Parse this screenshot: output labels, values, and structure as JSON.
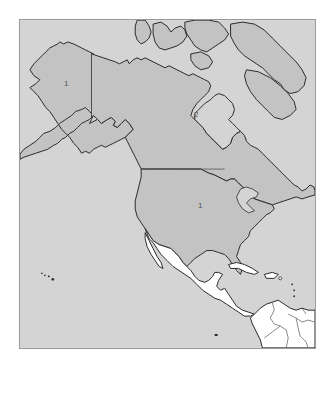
{
  "map": {
    "subject": "North America",
    "colors": {
      "ocean": "#d4d4d4",
      "highlighted_land": "#c3c3c3",
      "other_land": "#ffffff",
      "coastline": "#2a2a2a",
      "internal_border": "#555555",
      "frame": "#9a9a9a"
    },
    "regions": [
      {
        "name": "Alaska",
        "label": "1",
        "shaded": true
      },
      {
        "name": "Canada",
        "label": "2",
        "shaded": true
      },
      {
        "name": "Contiguous United States",
        "label": "1",
        "shaded": true
      },
      {
        "name": "Mexico",
        "label": "",
        "shaded": false
      },
      {
        "name": "Central America",
        "label": "",
        "shaded": false
      },
      {
        "name": "Caribbean",
        "label": "",
        "shaded": false
      },
      {
        "name": "South America",
        "label": "",
        "shaded": false
      }
    ],
    "labels": {
      "alaska": "1",
      "canada": "2",
      "usa": "1"
    }
  }
}
